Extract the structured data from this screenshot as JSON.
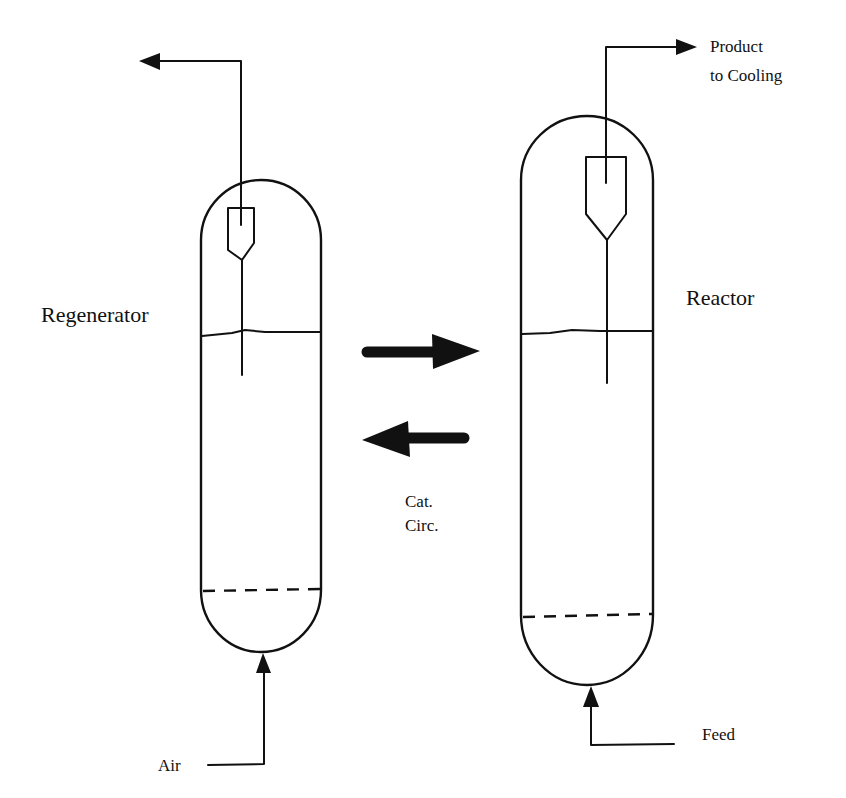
{
  "diagram": {
    "labels": {
      "regenerator": "Regenerator",
      "reactor": "Reactor",
      "product_line1": "Product",
      "product_line2": "to Cooling",
      "cat_circ_line1": "Cat.",
      "cat_circ_line2": "Circ.",
      "air": "Air",
      "feed": "Feed"
    },
    "vessels": [
      {
        "name": "Regenerator",
        "components": [
          "cyclone",
          "bed level",
          "distributor grid (dashed)"
        ],
        "inlet": "Air (bottom)",
        "outlet": "Flue gas (top, to left)"
      },
      {
        "name": "Reactor",
        "components": [
          "cyclone",
          "bed level",
          "distributor grid (dashed)"
        ],
        "inlet": "Feed (bottom)",
        "outlet": "Product to Cooling (top, to right)"
      }
    ],
    "flows": [
      {
        "from": "Regenerator",
        "to": "Reactor",
        "direction": "right"
      },
      {
        "from": "Reactor",
        "to": "Regenerator",
        "direction": "left"
      }
    ],
    "colors": {
      "ink": "#111111",
      "background": "#ffffff"
    }
  }
}
